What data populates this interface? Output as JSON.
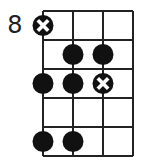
{
  "diagram": {
    "type": "fretboard-scale-diagram",
    "starting_fret_label": "8",
    "strings": 4,
    "frets_shown": 5,
    "colors": {
      "line": "#222222",
      "dot": "#111111",
      "x_mark": "#ffffff",
      "background": "#ffffff"
    },
    "markers": [
      {
        "fret_row": 1,
        "string": 1,
        "kind": "root-x"
      },
      {
        "fret_row": 2,
        "string": 2,
        "kind": "dot"
      },
      {
        "fret_row": 2,
        "string": 3,
        "kind": "dot"
      },
      {
        "fret_row": 3,
        "string": 1,
        "kind": "dot"
      },
      {
        "fret_row": 3,
        "string": 2,
        "kind": "dot"
      },
      {
        "fret_row": 3,
        "string": 3,
        "kind": "root-x"
      },
      {
        "fret_row": 5,
        "string": 1,
        "kind": "dot"
      },
      {
        "fret_row": 5,
        "string": 2,
        "kind": "dot"
      }
    ]
  }
}
